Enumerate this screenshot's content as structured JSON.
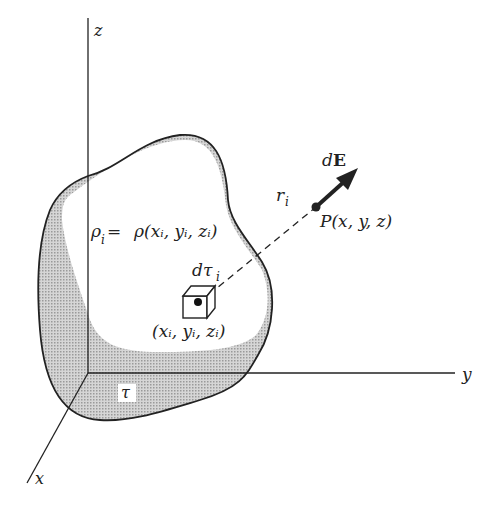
{
  "figure": {
    "axes": {
      "z_label": "z",
      "y_label": "y",
      "x_label": "x"
    },
    "labels": {
      "density_lhs": "ρ",
      "density_lhs_sub": "i",
      "density_eq": "=",
      "density_rhs": "ρ(x",
      "density_rhs_full": "ρ(xᵢ, yᵢ, zᵢ)",
      "volume_element": "dτ",
      "volume_element_sub": "i",
      "source_point": "(xᵢ, yᵢ, zᵢ)",
      "distance": "r",
      "distance_sub": "i",
      "field_point": "P(x, y, z)",
      "field_vector_d": "d",
      "field_vector_E": "E",
      "volume": "τ"
    },
    "colors": {
      "line": "#222222",
      "shade": "#bdbdbd",
      "background": "#ffffff"
    }
  }
}
